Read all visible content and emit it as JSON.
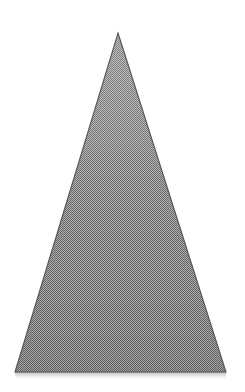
{
  "canvas": {
    "width": 245,
    "height": 392,
    "background_color": "#ffffff",
    "label": "triangle-figure"
  },
  "figure": {
    "name": "triangle",
    "type": "isoceles-triangle",
    "apex": {
      "x": 118,
      "y": 33
    },
    "base_left": {
      "x": 15,
      "y": 372
    },
    "base_right": {
      "x": 226,
      "y": 372
    },
    "points": "118,33 226,372 15,372",
    "base_width": 211,
    "height": 339,
    "fill_color": "#8a8a8a",
    "fill_color_top": "#9e9e9e",
    "fill_color_bottom": "#7d7d7d",
    "dither_light": "#c9c9c9",
    "dither_dark": "#6b6b6b",
    "outline_color": "#555555",
    "outline_width": 1
  },
  "shadow": {
    "name": "base-shadow",
    "color": "#d6d6d6",
    "top": 372,
    "height": 8,
    "left": 15,
    "right": 226
  },
  "chart_data": {
    "type": "scatter",
    "title": "",
    "xlabel": "",
    "ylabel": "",
    "grid": false,
    "legend": null,
    "x": [
      15,
      118,
      226
    ],
    "y": [
      372,
      33,
      372
    ],
    "annotations": [
      "apex",
      "base-left",
      "base-right"
    ]
  }
}
